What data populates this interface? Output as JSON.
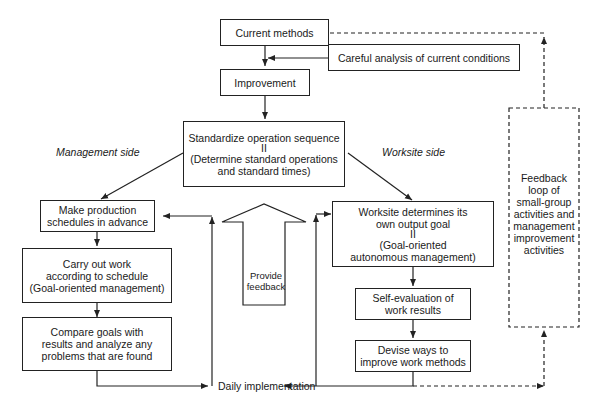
{
  "diagram": {
    "nodes": {
      "current_methods": {
        "lines": [
          "Current methods"
        ]
      },
      "careful_analysis": {
        "lines": [
          "Careful analysis of current conditions"
        ]
      },
      "improvement": {
        "lines": [
          "Improvement"
        ]
      },
      "standardize": {
        "lines": [
          "Standardize operation sequence",
          "II",
          "(Determine standard operations",
          "and standard times)"
        ]
      },
      "make_schedules": {
        "lines": [
          "Make production",
          "schedules in advance"
        ]
      },
      "carry_out": {
        "lines": [
          "Carry out work",
          "according to schedule",
          "(Goal-oriented management)"
        ]
      },
      "compare_goals": {
        "lines": [
          "Compare goals with",
          "results and analyze any",
          "problems that are found"
        ]
      },
      "worksite_goal": {
        "lines": [
          "Worksite determines its",
          "own output goal",
          "II",
          "(Goal-oriented",
          "autonomous management)"
        ]
      },
      "self_evaluation": {
        "lines": [
          "Self-evaluation of",
          "work results"
        ]
      },
      "devise_ways": {
        "lines": [
          "Devise ways to",
          "improve work methods"
        ]
      },
      "feedback_loop": {
        "lines": [
          "Feedback",
          "loop of",
          "small-group",
          "activities and",
          "management",
          "improvement",
          "activities"
        ]
      },
      "provide_feedback": {
        "lines": [
          "Provide",
          "feedback"
        ]
      }
    },
    "labels": {
      "management_side": "Management side",
      "worksite_side": "Worksite side",
      "daily_implementation": "Daily implementation"
    },
    "colors": {
      "line": "#222222",
      "background": "#ffffff",
      "text": "#1a1a1a"
    }
  }
}
